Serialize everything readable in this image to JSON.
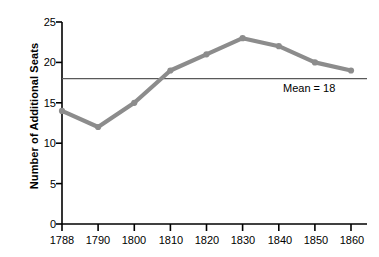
{
  "chart_data": {
    "type": "line",
    "title": "",
    "xlabel": "",
    "ylabel": "Number of Additional Seats",
    "categories": [
      "1788",
      "1790",
      "1800",
      "1810",
      "1820",
      "1830",
      "1840",
      "1850",
      "1860"
    ],
    "values": [
      14,
      12,
      15,
      19,
      21,
      23,
      22,
      20,
      19
    ],
    "series": [
      {
        "name": "Number of Additional Seats",
        "values": [
          14,
          12,
          15,
          19,
          21,
          23,
          22,
          20,
          19
        ]
      }
    ],
    "ylim": [
      0,
      25
    ],
    "yticks": [
      0,
      5,
      10,
      15,
      20,
      25
    ],
    "ytick_labels": [
      "0",
      "5",
      "10",
      "15",
      "20",
      "25"
    ],
    "xtick_labels": [
      "1788",
      "1790",
      "1800",
      "1810",
      "1820",
      "1830",
      "1840",
      "1850",
      "1860"
    ],
    "grid": false,
    "legend": false,
    "legend_position": "none",
    "annotations": [
      {
        "name": "mean-reference-line",
        "label": "Mean = 18",
        "value": 18,
        "orientation": "horizontal"
      }
    ],
    "colors": {
      "line": "#8c8c8c",
      "marker": "#8c8c8c",
      "axis": "#000000",
      "mean_line": "#595959",
      "background": "#ffffff",
      "text": "#000000"
    }
  }
}
